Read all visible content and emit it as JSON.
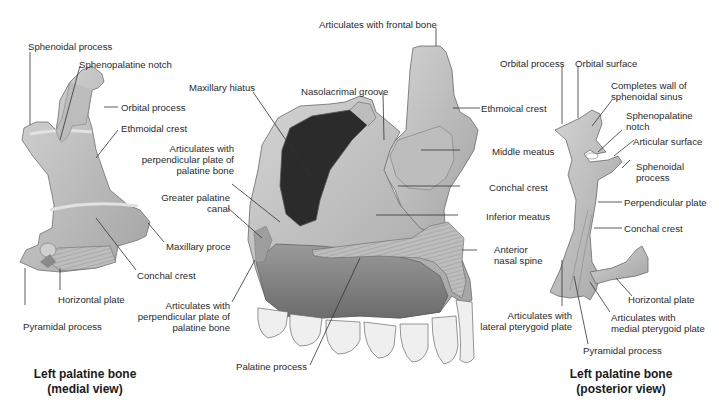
{
  "figure": {
    "left_bone": {
      "caption_line1": "Left palatine bone",
      "caption_line2": "(medial view)",
      "labels": {
        "sphenoidal_process": "Sphenoidal process",
        "sphenopalatine_notch": "Sphenopalatine notch",
        "orbital_process": "Orbital process",
        "ethmoidal_crest": "Ethmoidal crest",
        "maxillary_process": "Maxillary proce",
        "conchal_crest": "Conchal crest",
        "horizontal_plate": "Horizontal plate",
        "pyramidal_process": "Pyramidal process"
      }
    },
    "maxilla": {
      "labels": {
        "articulates_frontal": "Articulates with frontal bone",
        "maxillary_hiatus": "Maxillary hiatus",
        "nasolacrimal_groove": "Nasolacrimal groove",
        "ethmoidal_crest": "Ethmoical crest",
        "articulates_perp_upper_1": "Articulates with",
        "articulates_perp_upper_2": "perpendicular plate of",
        "articulates_perp_upper_3": "palatine bone",
        "greater_palatine_1": "Greater palatine",
        "greater_palatine_2": "canal",
        "middle_meatus": "Middle meatus",
        "conchal_crest": "Conchal crest",
        "inferior_meatus": "Inferior meatus",
        "anterior_nasal_1": "Anterior",
        "anterior_nasal_2": "nasal spine",
        "articulates_perp_lower_1": "Articulates with",
        "articulates_perp_lower_2": "perpendicular plate of",
        "articulates_perp_lower_3": "palatine bone",
        "palatine_process": "Palatine process"
      }
    },
    "right_bone": {
      "caption_line1": "Left palatine bone",
      "caption_line2": "(posterior view)",
      "labels": {
        "orbital_process": "Orbital process",
        "orbital_surface": "Orbital surface",
        "completes_wall_1": "Completes wall of",
        "completes_wall_2": "sphenoidal sinus",
        "sphenopalatine_1": "Sphenopalatine",
        "sphenopalatine_2": "notch",
        "articular_surface": "Articular surface",
        "sphenoidal_1": "Sphenoidal",
        "sphenoidal_2": "process",
        "perpendicular_plate": "Perpendicular plate",
        "conchal_crest": "Conchal crest",
        "horizontal_plate": "Horizontal plate",
        "articulates_lateral_1": "Articulates with",
        "articulates_lateral_2": "lateral pterygoid plate",
        "articulates_medial_1": "Articulates with",
        "articulates_medial_2": "medial pterygoid plate",
        "pyramidal_process": "Pyramidal process"
      }
    },
    "colors": {
      "bone_light": "#c9c9c9",
      "bone_mid": "#a9a9a9",
      "bone_dark": "#7a7a7a",
      "sinus": "#2b2b2b",
      "tooth": "#eeeeee",
      "label_text": "#2a2a2a"
    }
  }
}
